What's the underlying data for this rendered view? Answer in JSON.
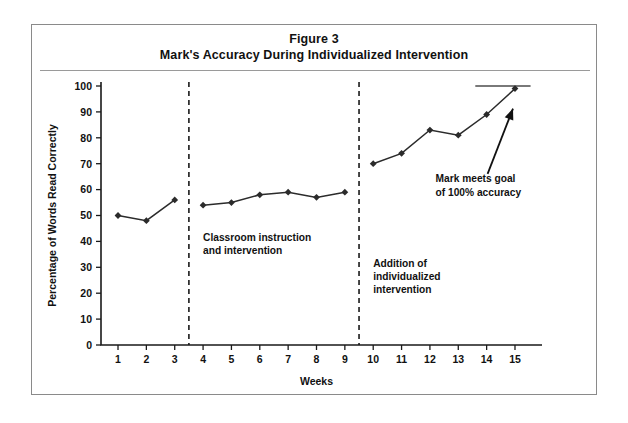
{
  "figure": {
    "title_line1": "Figure 3",
    "title_line2": "Mark's Accuracy During Individualized Intervention"
  },
  "chart_data": {
    "type": "line",
    "title": "Mark's Accuracy During Individualized Intervention",
    "xlabel": "Weeks",
    "ylabel": "Percentage of Words Read Correctly",
    "x": [
      1,
      2,
      3,
      4,
      5,
      6,
      7,
      8,
      9,
      10,
      11,
      12,
      13,
      14,
      15
    ],
    "xtick_labels": [
      "1",
      "2",
      "3",
      "4",
      "5",
      "6",
      "7",
      "8",
      "9",
      "10",
      "11",
      "12",
      "13",
      "14",
      "15"
    ],
    "ytick_labels": [
      "0",
      "10",
      "20",
      "30",
      "40",
      "50",
      "60",
      "70",
      "80",
      "90",
      "100"
    ],
    "ylim": [
      0,
      100
    ],
    "xlim": [
      0.4,
      15.6
    ],
    "grid": false,
    "legend": "none",
    "series": [
      {
        "name": "Percentage of Words Read Correctly",
        "values": [
          50,
          48,
          56,
          54,
          55,
          58,
          59,
          57,
          59,
          70,
          74,
          83,
          81,
          89,
          99
        ],
        "marker": "diamond",
        "color": "#2b2b2b"
      }
    ],
    "segments": [
      {
        "name": "baseline",
        "x_from": 1,
        "x_to": 3
      },
      {
        "name": "classroom-instruction-and-intervention",
        "x_from": 4,
        "x_to": 9
      },
      {
        "name": "addition-of-individualized-intervention",
        "x_from": 10,
        "x_to": 15
      }
    ],
    "phase_lines": [
      {
        "name": "phase-line-1",
        "x": 3.5,
        "style": "dashed"
      },
      {
        "name": "phase-line-2",
        "x": 9.5,
        "style": "dashed"
      }
    ],
    "goal_line": {
      "label": "100% accuracy goal",
      "y": 100,
      "x_from": 13.6,
      "x_to": 15.55,
      "color": "#4d4d4d"
    },
    "phase_labels": [
      {
        "name": "phase-label-classroom",
        "lines": [
          "Classroom instruction",
          "and intervention"
        ],
        "x": 4.0,
        "y": 40
      },
      {
        "name": "phase-label-individualized",
        "lines": [
          "Addition of",
          "individualized",
          "intervention"
        ],
        "x": 10.0,
        "y": 30
      }
    ],
    "annotations": [
      {
        "name": "goal-annotation",
        "lines": [
          "Mark meets goal",
          "of 100% accuracy"
        ],
        "x": 12.2,
        "y": 63,
        "points_to": {
          "x": 15,
          "y": 99
        },
        "arrow": true
      }
    ]
  }
}
